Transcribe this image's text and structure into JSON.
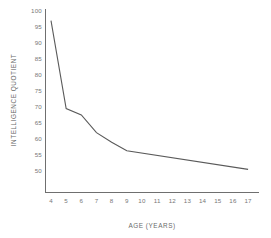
{
  "chart_data": {
    "type": "line",
    "title": "",
    "xlabel": "AGE (YEARS)",
    "ylabel": "INTELLIGENCE QUOTIENT",
    "xlim": [
      4,
      17
    ],
    "ylim": [
      50,
      100
    ],
    "grid": false,
    "legend": null,
    "x_ticks": [
      "4",
      "5",
      "6",
      "7",
      "8",
      "9",
      "10",
      "11",
      "12",
      "13",
      "14",
      "15",
      "16",
      "17"
    ],
    "y_ticks": [
      "100",
      "95",
      "90",
      "85",
      "80",
      "75",
      "70",
      "65",
      "60",
      "55",
      "50"
    ],
    "x": [
      4,
      5,
      6,
      7,
      8,
      9,
      17
    ],
    "values": [
      97,
      69.5,
      67.5,
      62,
      59,
      56.3,
      50.5
    ],
    "series": [
      {
        "name": "Intelligence quotient by age",
        "x": [
          4,
          5,
          6,
          7,
          8,
          9,
          17
        ],
        "values": [
          97,
          69.5,
          67.5,
          62,
          59,
          56.3,
          50.5
        ]
      }
    ],
    "line_color": "#5a5a5a",
    "axis_color": "#6f6f6f",
    "background_color": "#ffffff"
  }
}
